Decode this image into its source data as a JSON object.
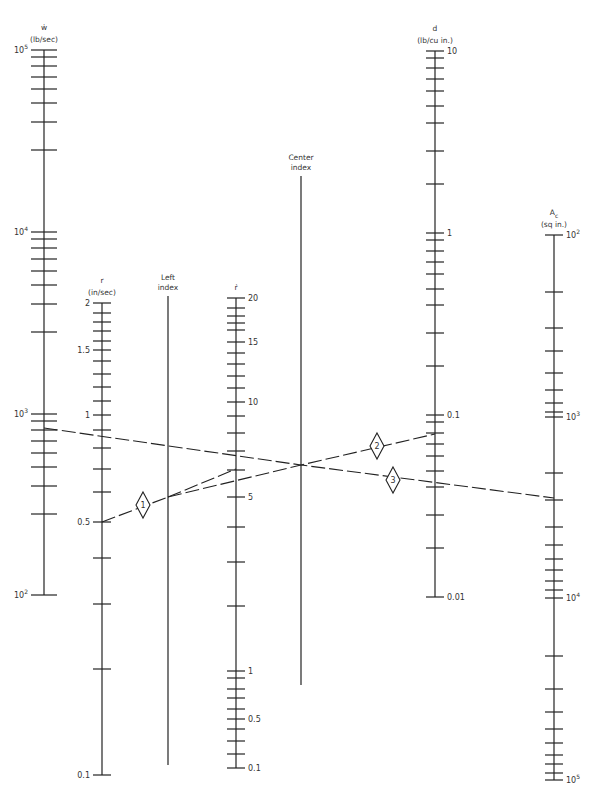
{
  "diagram": {
    "type": "nomograph",
    "axes": [
      {
        "id": "w_dot",
        "symbol": "ẇ",
        "unit": "(lb/sec)",
        "x": 44,
        "y_top": 50,
        "y_bottom": 595,
        "tick_half": 13,
        "label_side": "left",
        "major_labels": [
          {
            "text": "10",
            "sup": "5",
            "y": 50
          },
          {
            "text": "10",
            "sup": "4",
            "y": 232
          },
          {
            "text": "10",
            "sup": "3",
            "y": 414
          },
          {
            "text": "10",
            "sup": "2",
            "y": 595
          }
        ],
        "ticks": [
          50,
          57,
          66,
          77,
          89,
          103,
          122,
          150,
          232,
          239,
          248,
          259,
          271,
          285,
          304,
          332,
          414,
          421,
          430,
          441,
          453,
          467,
          486,
          514,
          595
        ]
      },
      {
        "id": "r",
        "symbol": "r",
        "unit": "(in/sec)",
        "x": 102,
        "y_top": 303,
        "y_bottom": 775,
        "tick_half": 9,
        "label_side": "left",
        "major_labels": [
          {
            "text": "2",
            "y": 303
          },
          {
            "text": "1.5",
            "y": 350
          },
          {
            "text": "1",
            "y": 415
          },
          {
            "text": "0.5",
            "y": 522
          },
          {
            "text": "0.1",
            "y": 775
          }
        ],
        "ticks": [
          303,
          313,
          322,
          331,
          341,
          350,
          361,
          374,
          387,
          401,
          415,
          430,
          448,
          469,
          492,
          522,
          558,
          604,
          669,
          775
        ]
      },
      {
        "id": "left_index",
        "title_line1": "Left",
        "title_line2": "index",
        "x": 168,
        "y_top": 296,
        "y_bottom": 765,
        "ticks": []
      },
      {
        "id": "r_dot",
        "symbol": "ṙ",
        "unit": "",
        "x": 236,
        "y_top": 298,
        "y_bottom": 768,
        "tick_half": 9,
        "label_side": "right",
        "major_labels": [
          {
            "text": "20",
            "y": 298
          },
          {
            "text": "15",
            "y": 342
          },
          {
            "text": "10",
            "y": 402
          },
          {
            "text": "5",
            "y": 497
          },
          {
            "text": "1",
            "y": 671
          },
          {
            "text": "0.5",
            "y": 719
          },
          {
            "text": "0.1",
            "y": 768
          }
        ],
        "ticks": [
          298,
          308,
          316,
          323,
          330,
          342,
          353,
          364,
          376,
          388,
          402,
          416,
          433,
          451,
          470,
          497,
          527,
          562,
          606,
          671,
          678,
          689,
          698,
          709,
          719,
          729,
          741,
          754,
          768
        ]
      },
      {
        "id": "center_index",
        "title_line1": "Center",
        "title_line2": "index",
        "x": 301,
        "y_top": 176,
        "y_bottom": 685,
        "ticks": []
      },
      {
        "id": "d",
        "symbol": "d",
        "unit": "(lb/cu in.)",
        "x": 435,
        "y_top": 51,
        "y_bottom": 597,
        "tick_half": 9,
        "label_side": "right",
        "major_labels": [
          {
            "text": "10",
            "y": 51
          },
          {
            "text": "1",
            "y": 233
          },
          {
            "text": "0.1",
            "y": 415
          },
          {
            "text": "0.01",
            "y": 597
          }
        ],
        "ticks": [
          51,
          58,
          68,
          79,
          91,
          106,
          123,
          151,
          184,
          233,
          240,
          251,
          262,
          274,
          289,
          305,
          333,
          366,
          415,
          422,
          433,
          444,
          456,
          471,
          487,
          515,
          548,
          597
        ]
      },
      {
        "id": "A_c",
        "symbol": "A",
        "symbol_sub": "c",
        "unit": "(sq in.)",
        "x": 554,
        "y_top": 235,
        "y_bottom": 780,
        "tick_half": 9,
        "label_side": "right",
        "major_labels": [
          {
            "text": "10",
            "sup": "2",
            "y": 235
          },
          {
            "text": "10",
            "sup": "3",
            "y": 417
          },
          {
            "text": "10",
            "sup": "4",
            "y": 598
          },
          {
            "text": "10",
            "sup": "5",
            "y": 780
          }
        ],
        "ticks": [
          235,
          292,
          328,
          351,
          373,
          390,
          403,
          412,
          417,
          473,
          500,
          527,
          545,
          559,
          570,
          581,
          590,
          598,
          656,
          689,
          712,
          729,
          743,
          755,
          764,
          773,
          780
        ]
      }
    ],
    "solution_lines": [
      {
        "id": "line-1",
        "points": [
          [
            102,
            522
          ],
          [
            168,
            497
          ]
        ],
        "marker": {
          "label": "1",
          "x": 143,
          "y": 505
        }
      },
      {
        "id": "line-1b",
        "points": [
          [
            168,
            497
          ],
          [
            236,
            469
          ]
        ],
        "marker": null
      },
      {
        "id": "line-2",
        "points": [
          [
            168,
            497
          ],
          [
            301,
            465
          ],
          [
            435,
            434
          ]
        ],
        "marker": {
          "label": "2",
          "x": 377,
          "y": 446
        }
      },
      {
        "id": "line-3",
        "points": [
          [
            44,
            428
          ],
          [
            301,
            465
          ],
          [
            554,
            498
          ]
        ],
        "marker": {
          "label": "3",
          "x": 393,
          "y": 480
        }
      }
    ]
  }
}
